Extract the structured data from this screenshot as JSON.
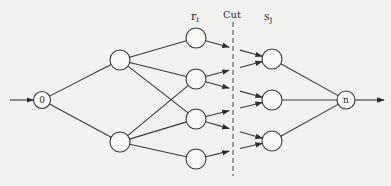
{
  "diagram": {
    "title": "",
    "colors": {
      "background": "#f1f1ef",
      "stroke": "#3a3a3a",
      "node_fill": "#f7f7f5",
      "text": "#2b2b2b"
    },
    "labels": {
      "r_main": "r",
      "r_sub": "i",
      "cut": "Cut",
      "s_main": "s",
      "s_sub": "j"
    },
    "nodes": [
      {
        "id": "source",
        "label": "0",
        "x": 42,
        "y": 100,
        "r": 8.5
      },
      {
        "id": "a1",
        "label": "",
        "x": 120,
        "y": 60,
        "r": 10
      },
      {
        "id": "a2",
        "label": "",
        "x": 120,
        "y": 142,
        "r": 10
      },
      {
        "id": "r1",
        "label": "",
        "x": 196,
        "y": 38,
        "r": 10
      },
      {
        "id": "r2",
        "label": "",
        "x": 196,
        "y": 79,
        "r": 10
      },
      {
        "id": "r3",
        "label": "",
        "x": 196,
        "y": 119,
        "r": 10
      },
      {
        "id": "r4",
        "label": "",
        "x": 196,
        "y": 159,
        "r": 10
      },
      {
        "id": "s1",
        "label": "",
        "x": 272,
        "y": 59,
        "r": 10
      },
      {
        "id": "s2",
        "label": "",
        "x": 272,
        "y": 100,
        "r": 10
      },
      {
        "id": "s3",
        "label": "",
        "x": 272,
        "y": 141,
        "r": 10
      },
      {
        "id": "sink",
        "label": "n",
        "x": 346,
        "y": 100,
        "r": 9
      }
    ],
    "edges": [
      {
        "from": "source",
        "to": "a1"
      },
      {
        "from": "source",
        "to": "a2"
      },
      {
        "from": "a1",
        "to": "r1"
      },
      {
        "from": "a1",
        "to": "r2"
      },
      {
        "from": "a1",
        "to": "r3"
      },
      {
        "from": "a2",
        "to": "r2"
      },
      {
        "from": "a2",
        "to": "r3"
      },
      {
        "from": "a2",
        "to": "r4"
      },
      {
        "from": "s1",
        "to": "sink"
      },
      {
        "from": "s2",
        "to": "sink"
      },
      {
        "from": "s3",
        "to": "sink"
      }
    ],
    "cut_edges": [
      {
        "from": "r1",
        "to": "s1"
      },
      {
        "from": "r2",
        "to": "s1"
      },
      {
        "from": "r2",
        "to": "s2"
      },
      {
        "from": "r3",
        "to": "s2"
      },
      {
        "from": "r3",
        "to": "s3"
      },
      {
        "from": "r4",
        "to": "s3"
      }
    ],
    "cut_x": 233,
    "cut_y_range": [
      22,
      176
    ],
    "input_arrow": {
      "x1": 10,
      "y": 100
    },
    "output_arrow": {
      "x2": 384,
      "y": 100
    }
  }
}
